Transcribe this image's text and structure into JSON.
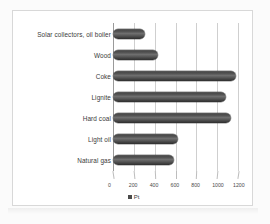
{
  "chart_data": {
    "type": "bar",
    "orientation": "horizontal",
    "title": "",
    "xlabel": "",
    "ylabel": "",
    "categories": [
      "Solar collectors, oil boiler",
      "Wood",
      "Coke",
      "Lignite",
      "Hard coal",
      "Light oil",
      "Natural gas"
    ],
    "series": [
      {
        "name": "Pt",
        "values": [
          310,
          430,
          1180,
          1080,
          1130,
          620,
          590
        ]
      }
    ],
    "xlim": [
      0,
      1200
    ],
    "xticks": [
      0,
      200,
      400,
      600,
      800,
      1000,
      1200
    ],
    "xtick_labels": [
      "0",
      "200",
      "400",
      "600",
      "800",
      "1000",
      "1200"
    ],
    "grid": true,
    "legend_position": "bottom",
    "legend_entries": [
      "Pt"
    ],
    "bar_color": "#4a4a4a",
    "gridline_color": "#cfcfcf",
    "axis_color": "#9a9a9a",
    "plot_background": "#ffffff",
    "frame_border_color": "#d8d8d8"
  },
  "legend": {
    "swatch_name": "legend-swatch-pt",
    "label": "Pt"
  }
}
